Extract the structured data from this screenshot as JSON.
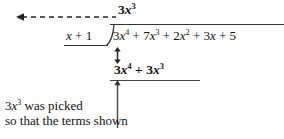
{
  "figure": {
    "type": "polynomial-long-division",
    "background_color": "#ffffff",
    "ink_color": "#111111"
  },
  "division": {
    "quotient": {
      "coefficient": "3",
      "variable": "x",
      "exponent": "3",
      "plain": "3x^3"
    },
    "divisor": {
      "plain": "x + 1",
      "term_variable": "x",
      "operator": "+",
      "constant": "1"
    },
    "dividend": {
      "plain": "3x^4 + 7x^3 + 2x^2 + 3x + 5",
      "terms": [
        {
          "coefficient": "3",
          "variable": "x",
          "exponent": "4"
        },
        {
          "operator": "+",
          "coefficient": "7",
          "variable": "x",
          "exponent": "3"
        },
        {
          "operator": "+",
          "coefficient": "2",
          "variable": "x",
          "exponent": "2"
        },
        {
          "operator": "+",
          "coefficient": "3",
          "variable": "x",
          "exponent": ""
        },
        {
          "operator": "+",
          "coefficient": "5",
          "variable": "",
          "exponent": ""
        }
      ]
    },
    "product": {
      "plain": "3x^4 + 3x^3",
      "terms": [
        {
          "coefficient": "3",
          "variable": "x",
          "exponent": "4"
        },
        {
          "operator": "+",
          "coefficient": "3",
          "variable": "x",
          "exponent": "3"
        }
      ]
    }
  },
  "annotations": {
    "dashed_arrow": {
      "icon": "dashed-left-arrow",
      "direction": "left",
      "style": "dashed"
    },
    "double_arrow": {
      "icon": "double-headed-vertical-arrow",
      "direction": "up-down",
      "style": "solid"
    },
    "up_pointer": {
      "icon": "up-arrow-line",
      "direction": "up",
      "style": "solid"
    },
    "caption": {
      "line1_plain": "3x^3 was picked",
      "line1_coefficient": "3",
      "line1_variable": "x",
      "line1_exponent": "3",
      "line1_text": " was picked",
      "line2_text": "so that the terms shown"
    }
  }
}
